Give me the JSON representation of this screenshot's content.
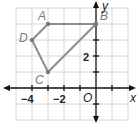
{
  "diagram": {
    "type": "coordinate-plane",
    "axes": {
      "x_label": "x",
      "y_label": "y",
      "origin_label": "O"
    },
    "grid": {
      "x_range": [
        -5,
        2
      ],
      "y_range": [
        -2,
        5
      ],
      "unit": 1
    },
    "tick_labels": {
      "x": [
        {
          "value": -4,
          "text": "−4"
        },
        {
          "value": -2,
          "text": "−2"
        }
      ],
      "y": [
        {
          "value": 2,
          "text": "2"
        }
      ]
    },
    "points": [
      {
        "name": "A",
        "x": -3,
        "y": 4
      },
      {
        "name": "B",
        "x": 0,
        "y": 4
      },
      {
        "name": "C",
        "x": -3,
        "y": 1
      },
      {
        "name": "D",
        "x": -4,
        "y": 3
      }
    ],
    "polygon": [
      "A",
      "B",
      "C",
      "D"
    ],
    "colors": {
      "polygon": "#8c8c8c",
      "grid": "#d6d6d6",
      "axis": "#111111",
      "label": "#7a7a7a"
    }
  }
}
